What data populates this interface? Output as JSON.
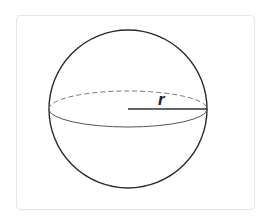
{
  "diagram": {
    "type": "sphere",
    "radius_label": "r",
    "colors": {
      "outline": "#2a2a2a",
      "equator_front": "#555555",
      "equator_back": "#777777",
      "radius_line": "#333333",
      "frame_border": "#e6e6e6"
    }
  }
}
